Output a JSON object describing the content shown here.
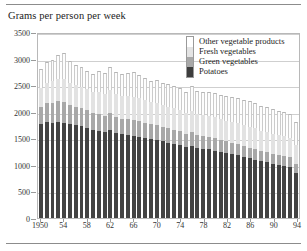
{
  "chart_data": {
    "type": "bar",
    "subtype": "stacked",
    "title": "Grams per person per week",
    "xlabel": "",
    "ylabel": "",
    "ylim": [
      0,
      3500
    ],
    "yticks": [
      0,
      500,
      1000,
      1500,
      2000,
      2500,
      3000,
      3500
    ],
    "grid": true,
    "legend_position": "top-right",
    "categories": [
      "1950",
      "1951",
      "1952",
      "1953",
      "1954",
      "1955",
      "1956",
      "1957",
      "1958",
      "1959",
      "1960",
      "1961",
      "1962",
      "1963",
      "1964",
      "1965",
      "1966",
      "1967",
      "1968",
      "1969",
      "1970",
      "1971",
      "1972",
      "1973",
      "1974",
      "1975",
      "1976",
      "1977",
      "1978",
      "1979",
      "1980",
      "1981",
      "1982",
      "1983",
      "1984",
      "1985",
      "1986",
      "1987",
      "1988",
      "1989",
      "1990",
      "1991",
      "1992",
      "1993",
      "1994"
    ],
    "xtick_labels": [
      "1950",
      "54",
      "58",
      "62",
      "66",
      "70",
      "74",
      "78",
      "82",
      "86",
      "90",
      "94"
    ],
    "xtick_categories": [
      "1950",
      "1954",
      "1958",
      "1962",
      "1966",
      "1970",
      "1974",
      "1978",
      "1982",
      "1986",
      "1990",
      "1994"
    ],
    "series": [
      {
        "name": "Potatoes",
        "color": "#434343",
        "values": [
          1760,
          1800,
          1790,
          1810,
          1790,
          1760,
          1745,
          1730,
          1700,
          1660,
          1640,
          1620,
          1650,
          1600,
          1580,
          1560,
          1540,
          1520,
          1500,
          1480,
          1470,
          1440,
          1420,
          1400,
          1380,
          1340,
          1360,
          1320,
          1300,
          1290,
          1270,
          1240,
          1220,
          1200,
          1180,
          1150,
          1120,
          1100,
          1070,
          1050,
          1020,
          1000,
          980,
          960,
          840
        ]
      },
      {
        "name": "Green vegetables",
        "color": "#a8a8a8",
        "values": [
          330,
          360,
          380,
          390,
          400,
          370,
          350,
          340,
          330,
          320,
          310,
          300,
          320,
          300,
          290,
          300,
          310,
          300,
          290,
          280,
          280,
          270,
          265,
          260,
          255,
          245,
          250,
          245,
          240,
          235,
          230,
          225,
          220,
          215,
          215,
          210,
          205,
          200,
          195,
          195,
          190,
          190,
          185,
          185,
          180
        ]
      },
      {
        "name": "Fresh vegetables",
        "color": "#e2e2e2",
        "values": [
          360,
          390,
          410,
          420,
          430,
          420,
          400,
          395,
          390,
          385,
          430,
          420,
          440,
          430,
          425,
          430,
          435,
          430,
          425,
          420,
          420,
          415,
          410,
          405,
          400,
          390,
          400,
          395,
          390,
          390,
          395,
          390,
          390,
          385,
          390,
          385,
          390,
          385,
          380,
          380,
          380,
          375,
          375,
          370,
          360
        ]
      },
      {
        "name": "Other vegetable products",
        "color": "#fdfdfd",
        "values": [
          350,
          380,
          400,
          450,
          490,
          400,
          380,
          370,
          355,
          350,
          390,
          380,
          440,
          420,
          410,
          430,
          460,
          440,
          420,
          400,
          420,
          415,
          425,
          420,
          415,
          405,
          480,
          430,
          440,
          450,
          460,
          455,
          465,
          470,
          475,
          470,
          480,
          475,
          470,
          470,
          465,
          455,
          450,
          440,
          430
        ]
      }
    ],
    "legend_entries": [
      {
        "label": "Other vegetable products",
        "color": "#ffffff"
      },
      {
        "label": "Fresh vegetables",
        "color": "#e4e4e4"
      },
      {
        "label": "Green vegetables",
        "color": "#a8a8a8"
      },
      {
        "label": "Potatoes",
        "color": "#3d3d3d"
      }
    ]
  }
}
